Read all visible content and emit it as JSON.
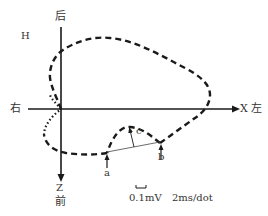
{
  "diagram": {
    "type": "vectorcardiogram-horizontal-plane-loop",
    "plane_label": "H",
    "axes": {
      "top_label": "后",
      "left_label": "右",
      "right_label": "X 左",
      "bottom_axis_letter": "Z",
      "bottom_label": "前"
    },
    "markers": {
      "a": "a",
      "b": "b",
      "c": "c"
    },
    "scale": {
      "voltage": "0.1mV",
      "time": "2ms/dot"
    },
    "colors": {
      "line": "#1a1a1a",
      "background": "#ffffff"
    }
  }
}
